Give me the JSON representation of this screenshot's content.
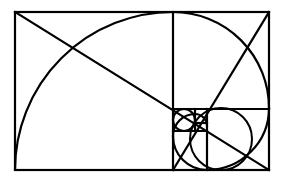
{
  "diagram": {
    "type": "golden-rectangle-spiral",
    "stroke_color": "#000000",
    "background_color": "#ffffff",
    "outer_rectangle": {
      "x": 15,
      "y": 12,
      "width": 254,
      "height": 158
    },
    "squares": [
      {
        "x": 15,
        "y": 12,
        "size": 158
      },
      {
        "x": 173,
        "y": 12,
        "size": 96
      },
      {
        "x": 207,
        "y": 108,
        "size": 62
      },
      {
        "x": 173,
        "y": 136,
        "size": 34
      },
      {
        "x": 173,
        "y": 108,
        "size": 22
      },
      {
        "x": 195,
        "y": 108,
        "size": 12
      }
    ],
    "diagonals": [
      {
        "x1": 15,
        "y1": 12,
        "x2": 269,
        "y2": 170
      },
      {
        "x1": 173,
        "y1": 170,
        "x2": 269,
        "y2": 12
      }
    ]
  }
}
